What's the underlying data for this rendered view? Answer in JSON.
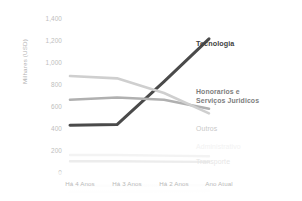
{
  "chart_data": {
    "type": "line",
    "title": "",
    "xlabel": "",
    "ylabel": "Milhares (USD)",
    "categories": [
      "Há 4 Anos",
      "Há 3 Anos",
      "Há 2 Anos",
      "Ano Atual"
    ],
    "ylim": [
      0,
      1400
    ],
    "yticks": [
      "0",
      "200",
      "400",
      "600",
      "800",
      "1,000",
      "1,200",
      "1,400"
    ],
    "ytick_values": [
      0,
      200,
      400,
      600,
      800,
      1000,
      1200,
      1400
    ],
    "grid": false,
    "legend_position": "right-inline-labels",
    "series": [
      {
        "name": "Tecnologia",
        "values": [
          415,
          420,
          800,
          1180
        ],
        "color": "#4a4a4a",
        "emphasis": "strong"
      },
      {
        "name": "Honorarios e Serviços Juridicos",
        "name_line1": "Honorarios e",
        "name_line2": "Serviços Juridicos",
        "values": [
          640,
          660,
          640,
          560
        ],
        "color": "#b0b0b0",
        "emphasis": "mid"
      },
      {
        "name": "Outros",
        "values": [
          850,
          830,
          700,
          520
        ],
        "color": "#cfcfcf",
        "emphasis": "soft"
      },
      {
        "name": "Administrativo",
        "values": [
          150,
          150,
          145,
          140
        ],
        "color": "#f3f3f3",
        "emphasis": "ghost"
      },
      {
        "name": "Transporte",
        "values": [
          95,
          95,
          92,
          90
        ],
        "color": "#ececec",
        "emphasis": "ghost2"
      }
    ]
  },
  "axis": {
    "y_title": "Milhares (USD)"
  }
}
